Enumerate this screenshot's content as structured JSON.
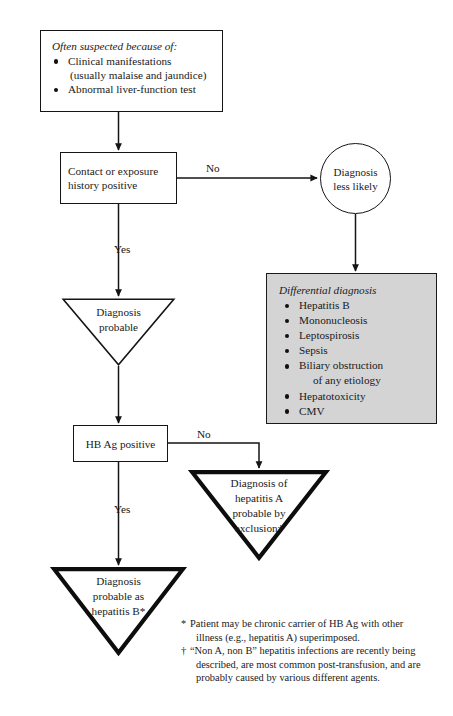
{
  "diagram": {
    "colors": {
      "line": "#151515",
      "differential_box_fill": "#d4d4d4",
      "page_background": "#ffffff"
    },
    "intro_box": {
      "heading": "Often suspected because of:",
      "bullets": [
        {
          "text": "Clinical manifestations",
          "continuation": "(usually malaise and jaundice)"
        },
        {
          "text": "Abnormal liver-function test",
          "continuation": ""
        }
      ]
    },
    "contact_box": {
      "line1": "Contact or exposure",
      "line2": "history positive"
    },
    "less_likely_circle": {
      "line1": "Diagnosis",
      "line2": "less likely"
    },
    "differential_box": {
      "heading": "Differential diagnosis",
      "bullets": [
        {
          "text": "Hepatitis B",
          "continuation": ""
        },
        {
          "text": "Mononucleosis",
          "continuation": ""
        },
        {
          "text": "Leptospirosis",
          "continuation": ""
        },
        {
          "text": "Sepsis",
          "continuation": ""
        },
        {
          "text": "Biliary obstruction",
          "continuation": "of any etiology"
        },
        {
          "text": "Hepatotoxicity",
          "continuation": ""
        },
        {
          "text": "CMV",
          "continuation": ""
        }
      ]
    },
    "triangle_probable": {
      "line1": "Diagnosis",
      "line2": "probable",
      "line3": "",
      "line4": ""
    },
    "hbag_box": {
      "line1": "HB Ag positive"
    },
    "triangle_hepatitis_a": {
      "line1": "Diagnosis of",
      "line2": "hepatitis A",
      "line3": "probable by",
      "line4": "exclusion†"
    },
    "triangle_hepatitis_b": {
      "line1": "Diagnosis",
      "line2": "probable as",
      "line3": "hepatitis B*",
      "line4": ""
    },
    "edges": {
      "no_1": "No",
      "yes_1": "Yes",
      "no_2": "No",
      "yes_2": "Yes"
    },
    "footnotes": [
      {
        "marker": "*",
        "line1": "Patient may be chronic carrier of HB Ag with other",
        "line2": "illness (e.g., hepatitis A) superimposed."
      },
      {
        "marker": "†",
        "line1": "“Non A, non B” hepatitis infections are recently being",
        "line2": "described, are most common post-transfusion, and are",
        "line3": "probably caused by various different agents."
      }
    ]
  }
}
